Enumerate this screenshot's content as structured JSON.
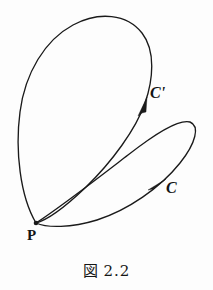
{
  "figure": {
    "caption_kanji": "図",
    "caption_number": "2.2",
    "background_color": "#fdfdfd",
    "ink_color": "#1a1a1a",
    "width": 213,
    "height": 290
  },
  "labels": {
    "c_prime": "C'",
    "c": "C",
    "p": "P"
  },
  "diagram_data": {
    "type": "topology-loop-diagram",
    "description": "Two oriented closed loops based at a common point P, crossing once",
    "base_point": {
      "name": "P",
      "x": 36,
      "y": 223
    },
    "crossing_point": {
      "x": 131,
      "y": 128
    },
    "curves": [
      {
        "name": "C-prime",
        "label": "C'",
        "label_position": {
          "x": 150,
          "y": 85
        },
        "orientation": "counterclockwise",
        "arrow_position": {
          "x": 143,
          "y": 108
        },
        "arrow_direction_degrees": -62,
        "extent": {
          "left": 16,
          "top": 17,
          "right": 152,
          "bottom": 223
        }
      },
      {
        "name": "C",
        "label": "C",
        "label_position": {
          "x": 166,
          "y": 180
        },
        "orientation": "counterclockwise",
        "arrow_position": {
          "x": 160,
          "y": 185
        },
        "arrow_direction_degrees": -38,
        "extent": {
          "left": 36,
          "top": 118,
          "right": 197,
          "bottom": 224
        }
      }
    ]
  }
}
